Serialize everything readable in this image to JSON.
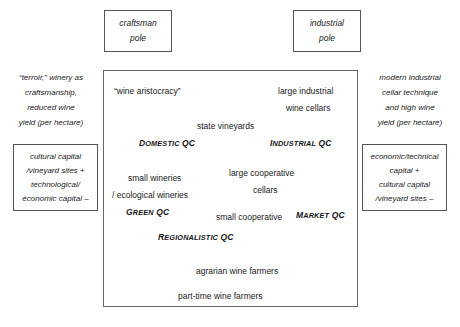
{
  "diagram": {
    "poles": {
      "left": {
        "line1": "craftsman",
        "line2": "pole"
      },
      "right": {
        "line1": "industrial",
        "line2": "pole"
      }
    },
    "side_descriptions": {
      "left": [
        "“terroir,” winery as",
        "craftsmanship,",
        "reduced wine",
        "yield (per hectare)"
      ],
      "right": [
        "modern industrial",
        "cellar technique",
        "and high wine",
        "yield (per hectare)"
      ]
    },
    "capital_boxes": {
      "left": [
        "cultural capital",
        "/vineyard sites +",
        "technological/",
        "economic capital –"
      ],
      "right": [
        "economic/technical",
        "capital +",
        "cultural capital",
        "/vineyard sites –"
      ]
    },
    "actors": [
      {
        "id": "wine-aristocracy",
        "label": "“wine aristocracy”"
      },
      {
        "id": "large-industrial-wine-cellars-1",
        "label": "large industrial"
      },
      {
        "id": "large-industrial-wine-cellars-2",
        "label": "wine cellars"
      },
      {
        "id": "state-vineyards",
        "label": "state vineyards"
      },
      {
        "id": "small-wineries",
        "label": "small wineries"
      },
      {
        "id": "ecological-wineries",
        "label": "/ ecological wineries"
      },
      {
        "id": "large-cooperative-cellars-1",
        "label": "large cooperative"
      },
      {
        "id": "large-cooperative-cellars-2",
        "label": "cellars"
      },
      {
        "id": "small-cooperative",
        "label": "small cooperative"
      },
      {
        "id": "agrarian-wine-farmers",
        "label": "agrarian wine farmers"
      },
      {
        "id": "part-time-wine-farmers",
        "label": "part-time wine farmers"
      }
    ],
    "conventions": [
      {
        "id": "domestic-qc",
        "first": "D",
        "rest": "OMESTIC",
        "tail": " QC"
      },
      {
        "id": "industrial-qc",
        "first": "I",
        "rest": "NDUSTRIAL",
        "tail": " QC"
      },
      {
        "id": "green-qc",
        "first": "G",
        "rest": "REEN",
        "tail": " QC"
      },
      {
        "id": "market-qc",
        "first": "M",
        "rest": "ARKET",
        "tail": " QC"
      },
      {
        "id": "regionalistic-qc",
        "first": "R",
        "rest": "EGIONALISTIC",
        "tail": " QC"
      }
    ],
    "colors": {
      "border": "#555555",
      "text": "#1a1a1a",
      "background": "#ffffff"
    }
  }
}
